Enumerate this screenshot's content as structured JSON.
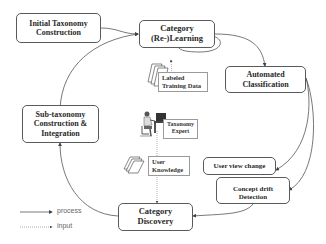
{
  "diagram": {
    "nodes": {
      "initial_taxonomy": {
        "lines": [
          "Initial Taxonomy",
          "Construction"
        ]
      },
      "category_learning": {
        "lines": [
          "Category",
          "(Re-)Learning"
        ]
      },
      "automated_classification": {
        "lines": [
          "Automated",
          "Classification"
        ]
      },
      "sub_taxonomy": {
        "lines": [
          "Sub-taxonomy",
          "Construction &",
          "Integration"
        ]
      },
      "user_view_change": {
        "lines": [
          "User view change"
        ]
      },
      "concept_drift": {
        "lines": [
          "Concept drift",
          "Detection"
        ]
      },
      "category_discovery": {
        "lines": [
          "Category",
          "Discovery"
        ]
      }
    },
    "inputs": {
      "labeled_training_data": {
        "lines": [
          "Labeled",
          "Training Data"
        ],
        "icon": "document-stack-icon"
      },
      "taxonomy_expert": {
        "lines": [
          "Taxonomy",
          "Expert"
        ],
        "icon": "person-at-computer-icon"
      },
      "user_knowledge": {
        "lines": [
          "User",
          "Knowledge"
        ],
        "icon": "document-stack-icon"
      }
    },
    "legend": {
      "process": "process",
      "input": "input"
    },
    "colors": {
      "line": "#555555",
      "border": "#5a5a5a",
      "text": "#2a2a2a"
    }
  }
}
